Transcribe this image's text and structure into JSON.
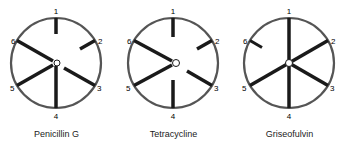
{
  "figure": {
    "spoke_labels": [
      "1",
      "2",
      "3",
      "4",
      "5",
      "6"
    ],
    "panels": [
      {
        "caption": "Penicillin G",
        "inhibition": [
          {
            "spoke": "1",
            "extent": 0.35
          },
          {
            "spoke": "2",
            "extent": 0.4
          },
          {
            "spoke": "3",
            "extent": 0.85
          },
          {
            "spoke": "4",
            "extent": 1.0
          },
          {
            "spoke": "5",
            "extent": 1.0
          },
          {
            "spoke": "6",
            "extent": 1.0
          }
        ]
      },
      {
        "caption": "Tetracycline",
        "inhibition": [
          {
            "spoke": "1",
            "extent": 0.45
          },
          {
            "spoke": "2",
            "extent": 0.4
          },
          {
            "spoke": "3",
            "extent": 0.7
          },
          {
            "spoke": "4",
            "extent": 0.75
          },
          {
            "spoke": "5",
            "extent": 1.0
          },
          {
            "spoke": "6",
            "extent": 1.0
          }
        ]
      },
      {
        "caption": "Griseofulvin",
        "inhibition": [
          {
            "spoke": "1",
            "extent": 1.0
          },
          {
            "spoke": "2",
            "extent": 1.0
          },
          {
            "spoke": "3",
            "extent": 1.0
          },
          {
            "spoke": "4",
            "extent": 1.0
          },
          {
            "spoke": "5",
            "extent": 1.0
          },
          {
            "spoke": "6",
            "extent": 0.3
          }
        ]
      }
    ]
  },
  "colors": {
    "line": "#1a1a1a",
    "background": "#ffffff"
  }
}
